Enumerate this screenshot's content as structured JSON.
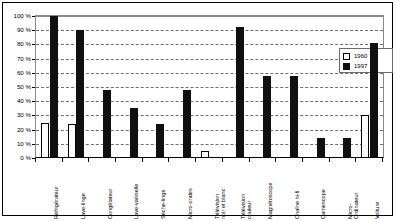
{
  "chart_data": {
    "type": "bar",
    "title": "",
    "subtitle": "",
    "xlabel": "",
    "ylabel": "",
    "ylim": [
      0,
      100
    ],
    "ytick_labels": [
      "100 %",
      "90 %",
      "80 %",
      "70 %",
      "60 %",
      "50 %",
      "40 %",
      "30 %",
      "20 %",
      "10 %",
      "0 %"
    ],
    "ytick_values": [
      100,
      90,
      80,
      70,
      60,
      50,
      40,
      30,
      20,
      10,
      0
    ],
    "grid": true,
    "grid_style": "dashed horizontal",
    "legend_position": "top-right inside plot",
    "categories": [
      "Réfrigérateur",
      "Lave-linge",
      "Congélateur",
      "Lave-vaisselle",
      "Sèche-linge",
      "Micro-ondes",
      "Télévision noir et blanc",
      "Télévision couleur",
      "Magnétoscope",
      "Chaîne hi-fi",
      "Camescope",
      "Micro-Ordinateur",
      "Voiture"
    ],
    "category_lines": [
      [
        "Réfrigérateur"
      ],
      [
        "Lave-linge"
      ],
      [
        "Congélateur"
      ],
      [
        "Lave-vaisselle"
      ],
      [
        "Sèche-linge"
      ],
      [
        "Micro-ondes"
      ],
      [
        "Télévision",
        "noir et blanc"
      ],
      [
        "Télévision",
        "couleur"
      ],
      [
        "Magnétoscope"
      ],
      [
        "Chaîne hi-fi"
      ],
      [
        "Camescope"
      ],
      [
        "Micro-",
        "Ordinateur"
      ],
      [
        "Voiture"
      ]
    ],
    "series": [
      {
        "name": "1960",
        "color": "#ffffff",
        "values": [
          25,
          24,
          0,
          0,
          0,
          0,
          5,
          0,
          0,
          0,
          0,
          0,
          30
        ]
      },
      {
        "name": "1997",
        "color": "#101010",
        "values": [
          100,
          90,
          48,
          35,
          24,
          48,
          0,
          92,
          58,
          58,
          14,
          14,
          81
        ]
      }
    ]
  },
  "legend": {
    "entries": [
      {
        "label": "1960",
        "swatch": "white-square"
      },
      {
        "label": "1997",
        "swatch": "black-square"
      }
    ]
  }
}
